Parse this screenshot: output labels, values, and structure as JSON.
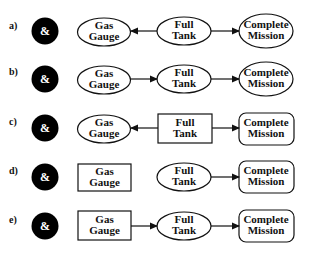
{
  "diagram": {
    "rows": [
      {
        "label": "a)",
        "and_symbol": "&",
        "nodes": [
          {
            "id": "gas",
            "line1": "Gas",
            "line2": "Gauge",
            "shape": "ellipse"
          },
          {
            "id": "full",
            "line1": "Full",
            "line2": "Tank",
            "shape": "ellipse"
          },
          {
            "id": "mission",
            "line1": "Complete",
            "line2": "Mission",
            "shape": "ellipse"
          }
        ],
        "edges": [
          {
            "from": "full",
            "to": "gas"
          },
          {
            "from": "full",
            "to": "mission"
          }
        ]
      },
      {
        "label": "b)",
        "and_symbol": "&",
        "nodes": [
          {
            "id": "gas",
            "line1": "Gas",
            "line2": "Gauge",
            "shape": "ellipse"
          },
          {
            "id": "full",
            "line1": "Full",
            "line2": "Tank",
            "shape": "ellipse"
          },
          {
            "id": "mission",
            "line1": "Complete",
            "line2": "Mission",
            "shape": "ellipse"
          }
        ],
        "edges": [
          {
            "from": "gas",
            "to": "full"
          },
          {
            "from": "full",
            "to": "mission"
          }
        ]
      },
      {
        "label": "c)",
        "and_symbol": "&",
        "nodes": [
          {
            "id": "gas",
            "line1": "Gas",
            "line2": "Gauge",
            "shape": "ellipse"
          },
          {
            "id": "full",
            "line1": "Full",
            "line2": "Tank",
            "shape": "rectangle"
          },
          {
            "id": "mission",
            "line1": "Complete",
            "line2": "Mission",
            "shape": "rounded-rectangle"
          }
        ],
        "edges": [
          {
            "from": "full",
            "to": "gas"
          },
          {
            "from": "full",
            "to": "mission"
          }
        ]
      },
      {
        "label": "d)",
        "and_symbol": "&",
        "nodes": [
          {
            "id": "gas",
            "line1": "Gas",
            "line2": "Gauge",
            "shape": "rectangle"
          },
          {
            "id": "full",
            "line1": "Full",
            "line2": "Tank",
            "shape": "ellipse"
          },
          {
            "id": "mission",
            "line1": "Complete",
            "line2": "Mission",
            "shape": "rounded-rectangle"
          }
        ],
        "edges": [
          {
            "from": "full",
            "to": "mission"
          }
        ]
      },
      {
        "label": "e)",
        "and_symbol": "&",
        "nodes": [
          {
            "id": "gas",
            "line1": "Gas",
            "line2": "Gauge",
            "shape": "rectangle"
          },
          {
            "id": "full",
            "line1": "Full",
            "line2": "Tank",
            "shape": "ellipse"
          },
          {
            "id": "mission",
            "line1": "Complete",
            "line2": "Mission",
            "shape": "rounded-rectangle"
          }
        ],
        "edges": [
          {
            "from": "gas",
            "to": "full"
          },
          {
            "from": "full",
            "to": "mission"
          }
        ]
      }
    ]
  }
}
